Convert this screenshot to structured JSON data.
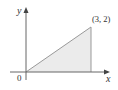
{
  "chart_data": {
    "type": "area",
    "title": "",
    "xlabel": "x",
    "ylabel": "y",
    "xlim": [
      0,
      3.3
    ],
    "ylim": [
      0,
      2.8
    ],
    "series": [
      {
        "name": "region",
        "points": [
          [
            0,
            0
          ],
          [
            3,
            2
          ],
          [
            3,
            0
          ]
        ],
        "fill": "#ebebeb",
        "stroke": "#999999"
      }
    ],
    "annotations": [
      {
        "text": "(3, 2)",
        "x": 3,
        "y": 2
      }
    ],
    "origin_label": "0",
    "grid": false,
    "legend": "none"
  },
  "colors": {
    "axis": "#666666",
    "fill": "#ebebeb",
    "edge": "#999999"
  }
}
